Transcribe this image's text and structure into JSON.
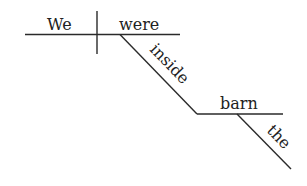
{
  "diagram": {
    "type": "sentence-diagram",
    "sentence": "We were inside the barn",
    "subject": "We",
    "verb": "were",
    "preposition": "inside",
    "object_of_preposition": "barn",
    "article": "the"
  }
}
